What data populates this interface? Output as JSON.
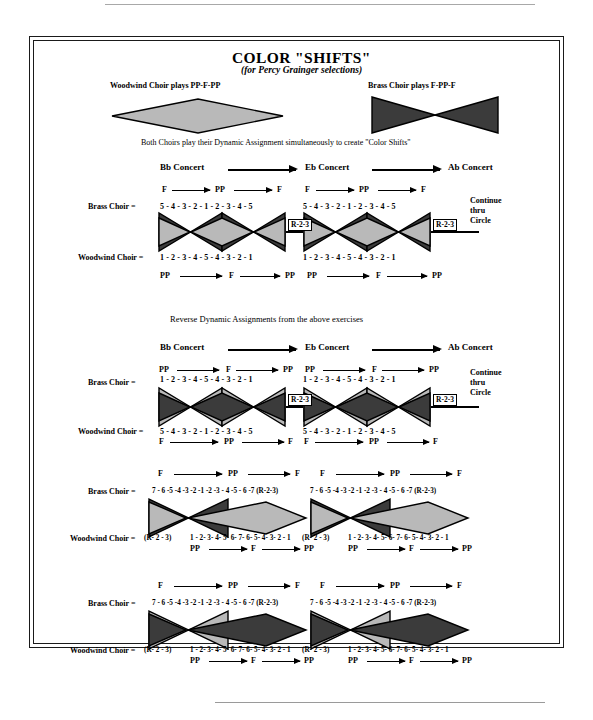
{
  "title": "COLOR \"SHIFTS\"",
  "subtitle": "(for Percy Grainger selections)",
  "legend": {
    "woodwind_caption": "Woodwind Choir plays PP-F-PP",
    "brass_caption": "Brass Choir plays F-PP-F",
    "both_caption": "Both Choirs play their Dynamic Assignment simultaneously to create \"Color Shifts\""
  },
  "section_note": "Reverse Dynamic Assignments from the above exercises",
  "labels": {
    "brass": "Brass Choir  =",
    "woodwind": "Woodwind Choir  =",
    "continue": "Continue\nthru\nCircle",
    "r23": "R-2-3",
    "key_bb": "Bb Concert",
    "key_eb": "Eb Concert",
    "key_ab": "Ab Concert",
    "f": "F",
    "pp": "PP"
  },
  "colors": {
    "dark": "#3b3b3b",
    "light": "#b9b9b9",
    "outline": "#000000",
    "rule": "#a8a8a8"
  },
  "exercises": [
    {
      "id": "exercise-1",
      "keys": [
        "Bb Concert",
        "Eb Concert",
        "Ab Concert"
      ],
      "brass": {
        "dynamics": [
          "F",
          "PP",
          "F"
        ],
        "series": "5 - 4 - 3 - 2 - 1 - 2 - 3 - 4 - 5",
        "shape": "bowtie",
        "shade": "dark"
      },
      "woodwind": {
        "dynamics": [
          "PP",
          "F",
          "PP"
        ],
        "series": "1 - 2 - 3 - 4 - 5 - 4 -  3 - 2 - 1",
        "shape": "diamond",
        "shade": "light"
      },
      "tag": "R-2-3",
      "continue": "Continue\nthru\nCircle"
    },
    {
      "id": "exercise-2",
      "keys": [
        "Bb Concert",
        "Eb Concert",
        "Ab Concert"
      ],
      "brass": {
        "dynamics": [
          "PP",
          "F",
          "PP"
        ],
        "series": "1 - 2 - 3 - 4 - 5 - 4 - 3  - 2 - 1",
        "shape": "bowtie",
        "shade": "light"
      },
      "woodwind": {
        "dynamics": [
          "F",
          "PP",
          "F"
        ],
        "series": "5 - 4 - 3 - 2 - 1 - 2 - 3  - 4 - 5",
        "shape": "diamond",
        "shade": "dark"
      },
      "tag": "R-2-3",
      "continue": "Continue\nthru\nCircle"
    },
    {
      "id": "exercise-3",
      "brass": {
        "dynamics": [
          "F",
          "PP",
          "F"
        ],
        "series": "7 - 6 -5 -4 -3 -2 -1 -2 -3 - 4 -5  - 6 -7 (R-2-3)",
        "shape": "bowtie",
        "shade": "dark"
      },
      "woodwind": {
        "dynamics": [
          "PP",
          "F",
          "PP"
        ],
        "prefix": "(R- 2 - 3)",
        "series": "1 - 2- 3- 4- 5- 6- 7- 6- 5- 4- 3-  2 - 1",
        "shape": "diamond",
        "shade": "light"
      }
    },
    {
      "id": "exercise-4",
      "brass": {
        "dynamics": [
          "F",
          "PP",
          "F"
        ],
        "series": "7 - 6 -5 -4 -3 -2 -1 -2 -3 - 4 -5  - 6 -7 (R-2-3)",
        "shape": "bowtie",
        "shade": "light"
      },
      "woodwind": {
        "dynamics": [
          "PP",
          "F",
          "PP"
        ],
        "prefix": "(R- 2 - 3)",
        "series": "1 - 2- 3- 4- 5- 6- 7- 6- 5- 4- 3-  2 - 1",
        "shape": "diamond",
        "shade": "dark"
      }
    }
  ]
}
